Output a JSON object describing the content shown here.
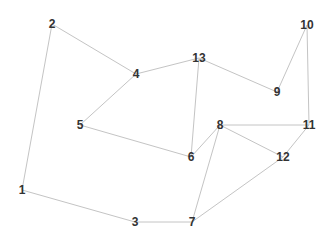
{
  "diagram": {
    "type": "undirected-graph",
    "colors": {
      "background": "#ffffff",
      "edge": "#c4c4c4",
      "label": "#333333"
    },
    "nodes": [
      {
        "id": "1",
        "label": "1",
        "x": 22,
        "y": 190
      },
      {
        "id": "2",
        "label": "2",
        "x": 52,
        "y": 24
      },
      {
        "id": "3",
        "label": "3",
        "x": 135,
        "y": 222
      },
      {
        "id": "4",
        "label": "4",
        "x": 136,
        "y": 74
      },
      {
        "id": "5",
        "label": "5",
        "x": 80,
        "y": 125
      },
      {
        "id": "6",
        "label": "6",
        "x": 191,
        "y": 157
      },
      {
        "id": "7",
        "label": "7",
        "x": 192,
        "y": 222
      },
      {
        "id": "8",
        "label": "8",
        "x": 220,
        "y": 125
      },
      {
        "id": "9",
        "label": "9",
        "x": 277,
        "y": 92
      },
      {
        "id": "10",
        "label": "10",
        "x": 307,
        "y": 25
      },
      {
        "id": "11",
        "label": "11",
        "x": 309,
        "y": 125
      },
      {
        "id": "12",
        "label": "12",
        "x": 283,
        "y": 157
      },
      {
        "id": "13",
        "label": "13",
        "x": 199,
        "y": 58
      }
    ],
    "edges": [
      {
        "from": "1",
        "to": "2"
      },
      {
        "from": "2",
        "to": "4"
      },
      {
        "from": "4",
        "to": "13"
      },
      {
        "from": "4",
        "to": "5"
      },
      {
        "from": "5",
        "to": "6"
      },
      {
        "from": "13",
        "to": "6"
      },
      {
        "from": "13",
        "to": "9"
      },
      {
        "from": "9",
        "to": "10"
      },
      {
        "from": "10",
        "to": "11"
      },
      {
        "from": "8",
        "to": "11"
      },
      {
        "from": "8",
        "to": "6"
      },
      {
        "from": "8",
        "to": "7"
      },
      {
        "from": "8",
        "to": "12"
      },
      {
        "from": "12",
        "to": "11"
      },
      {
        "from": "7",
        "to": "12"
      },
      {
        "from": "3",
        "to": "7"
      },
      {
        "from": "1",
        "to": "3"
      }
    ]
  }
}
